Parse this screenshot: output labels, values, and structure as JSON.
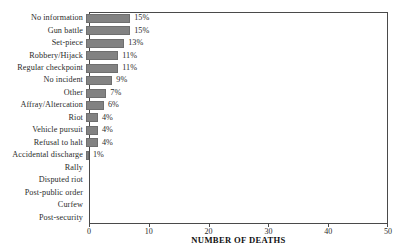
{
  "chart_data": {
    "type": "bar",
    "orientation": "horizontal",
    "title": "",
    "xlabel": "NUMBER OF DEATHS",
    "ylabel": "",
    "xlim": [
      0,
      50
    ],
    "xticks": [
      0,
      10,
      20,
      30,
      40,
      50
    ],
    "grid": false,
    "legend": null,
    "bar_color": "#828282",
    "categories": [
      "No information",
      "Gun battle",
      "Set-piece",
      "Robbery/Hijack",
      "Regular checkpoint",
      "No incident",
      "Other",
      "Affray/Altercation",
      "Riot",
      "Vehicle pursuit",
      "Refusal to halt",
      "Accidental discharge",
      "Rally",
      "Disputed riot",
      "Post-public order",
      "Curfew",
      "Post-security"
    ],
    "values": [
      7.4,
      7.4,
      6.4,
      5.4,
      5.4,
      4.4,
      3.4,
      3.0,
      2.0,
      2.0,
      2.0,
      0.5,
      0,
      0,
      0,
      0,
      0
    ],
    "data_labels": [
      "15%",
      "15%",
      "13%",
      "11%",
      "11%",
      "9%",
      "7%",
      "6%",
      "4%",
      "4%",
      "4%",
      "1%",
      "",
      "",
      "",
      "",
      ""
    ],
    "percentages": [
      15,
      15,
      13,
      11,
      11,
      9,
      7,
      6,
      4,
      4,
      4,
      1,
      0,
      0,
      0,
      0,
      0
    ]
  }
}
